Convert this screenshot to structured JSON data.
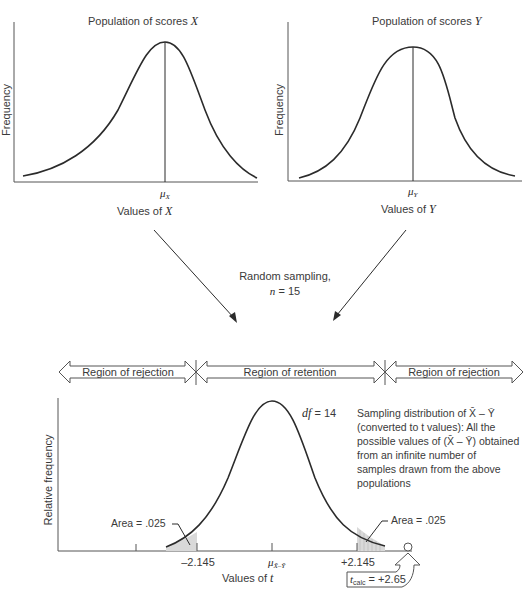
{
  "top_left_panel": {
    "title_text": "Population of scores ",
    "title_var": "X",
    "y_label": "Frequency",
    "mean_label": "μ",
    "mean_sub": "X",
    "x_label_text": "Values of ",
    "x_label_var": "X"
  },
  "top_right_panel": {
    "title_text": "Population of scores ",
    "title_var": "Y",
    "y_label": "Frequency",
    "mean_label": "μ",
    "mean_sub": "Y",
    "x_label_text": "Values of ",
    "x_label_var": "Y"
  },
  "sampling": {
    "line1": "Random sampling,",
    "n_var": "n",
    "n_value": " = 15"
  },
  "regions": {
    "left": "Region of rejection",
    "middle": "Region of retention",
    "right": "Region of rejection"
  },
  "bottom_panel": {
    "y_label": "Relative frequency",
    "df_var": "df",
    "df_value": " = 14",
    "description_lines": [
      "Sampling distribution of X̄ – Ȳ",
      "(converted to t values): All the",
      "possible values of (X̄ – Ȳ) obtained",
      "from an infinite number of",
      "samples drawn from the above",
      "populations"
    ],
    "area_left": "Area = .025",
    "area_right": "Area = .025",
    "tick_left": "–2.145",
    "tick_mean_label": "μ",
    "tick_mean_sub": "X̄–Ȳ",
    "tick_right": "+2.145",
    "x_label_text": "Values of ",
    "x_label_var": "t",
    "t_calc_var": "t",
    "t_calc_sub": "calc",
    "t_calc_value": " = +2.65"
  },
  "colors": {
    "line": "#2b2b2b",
    "shade": "#d9d9d9",
    "text": "#3a3a3a"
  }
}
